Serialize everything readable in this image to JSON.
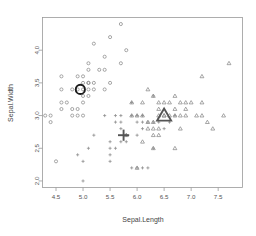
{
  "chart_data": {
    "type": "scatter",
    "title": "",
    "xlabel": "Sepal.Length",
    "ylabel": "Sepal.Width",
    "xlim": [
      4.25,
      7.95
    ],
    "ylim": [
      1.9,
      4.5
    ],
    "xticks": [
      4.5,
      5.0,
      5.5,
      6.0,
      6.5,
      7.0,
      7.5
    ],
    "xtick_labels": [
      "4.5",
      "5.0",
      "5.5",
      "6.0",
      "6.5",
      "7.0",
      "7.5"
    ],
    "yticks": [
      2.0,
      2.5,
      3.0,
      3.5,
      4.0
    ],
    "ytick_labels": [
      "2.0",
      "2.5",
      "3.0",
      "3.5",
      "4.0"
    ],
    "grid": false,
    "legend": "none",
    "series": [
      {
        "name": "cluster-1",
        "marker": "circle",
        "color": "#8a8a8a",
        "points": [
          [
            4.4,
            2.9
          ],
          [
            4.3,
            3.0
          ],
          [
            4.4,
            3.0
          ],
          [
            4.5,
            2.3
          ],
          [
            4.6,
            3.1
          ],
          [
            4.6,
            3.4
          ],
          [
            4.6,
            3.6
          ],
          [
            4.6,
            3.2
          ],
          [
            4.7,
            3.2
          ],
          [
            4.8,
            3.0
          ],
          [
            4.8,
            3.4
          ],
          [
            4.8,
            3.1
          ],
          [
            4.9,
            3.0
          ],
          [
            4.9,
            3.1
          ],
          [
            4.9,
            3.6
          ],
          [
            5.0,
            3.0
          ],
          [
            5.0,
            3.2
          ],
          [
            5.0,
            3.3
          ],
          [
            5.0,
            3.4
          ],
          [
            5.0,
            3.5
          ],
          [
            5.0,
            3.6
          ],
          [
            5.1,
            3.3
          ],
          [
            5.1,
            3.4
          ],
          [
            5.1,
            3.5
          ],
          [
            5.1,
            3.7
          ],
          [
            5.1,
            3.8
          ],
          [
            5.2,
            3.4
          ],
          [
            5.2,
            3.5
          ],
          [
            5.2,
            4.1
          ],
          [
            5.3,
            3.7
          ],
          [
            5.4,
            3.4
          ],
          [
            5.4,
            3.7
          ],
          [
            5.4,
            3.9
          ],
          [
            5.5,
            3.5
          ],
          [
            5.5,
            4.2
          ],
          [
            5.7,
            3.8
          ],
          [
            5.7,
            4.4
          ],
          [
            5.8,
            4.0
          ],
          [
            4.9,
            3.4
          ],
          [
            5.1,
            3.5
          ]
        ]
      },
      {
        "name": "cluster-2",
        "marker": "plus",
        "color": "#8a8a8a",
        "points": [
          [
            4.9,
            2.4
          ],
          [
            5.0,
            2.0
          ],
          [
            5.0,
            2.3
          ],
          [
            5.1,
            2.5
          ],
          [
            5.5,
            2.3
          ],
          [
            5.5,
            2.4
          ],
          [
            5.5,
            2.5
          ],
          [
            5.5,
            2.6
          ],
          [
            5.6,
            2.5
          ],
          [
            5.6,
            2.9
          ],
          [
            5.6,
            3.0
          ],
          [
            5.7,
            2.6
          ],
          [
            5.7,
            2.8
          ],
          [
            5.7,
            2.9
          ],
          [
            5.7,
            3.0
          ],
          [
            5.8,
            2.6
          ],
          [
            5.8,
            2.7
          ],
          [
            5.9,
            3.0
          ],
          [
            5.9,
            3.2
          ],
          [
            5.9,
            2.2
          ],
          [
            6.0,
            2.7
          ],
          [
            6.0,
            2.9
          ],
          [
            6.0,
            3.0
          ],
          [
            6.1,
            2.8
          ],
          [
            6.1,
            2.9
          ],
          [
            6.1,
            3.0
          ],
          [
            6.1,
            2.2
          ],
          [
            6.2,
            2.9
          ],
          [
            6.3,
            2.5
          ],
          [
            6.3,
            2.9
          ],
          [
            6.4,
            2.9
          ],
          [
            6.5,
            2.8
          ],
          [
            6.6,
            2.9
          ],
          [
            6.7,
            3.0
          ],
          [
            5.2,
            2.7
          ],
          [
            5.4,
            3.0
          ],
          [
            5.8,
            2.7
          ],
          [
            6.0,
            2.2
          ],
          [
            6.2,
            2.2
          ],
          [
            6.3,
            3.3
          ]
        ]
      },
      {
        "name": "cluster-3",
        "marker": "triangle",
        "color": "#8a8a8a",
        "points": [
          [
            5.8,
            2.7
          ],
          [
            5.9,
            3.0
          ],
          [
            5.9,
            3.2
          ],
          [
            6.0,
            2.2
          ],
          [
            6.0,
            3.0
          ],
          [
            6.1,
            2.6
          ],
          [
            6.1,
            3.0
          ],
          [
            6.2,
            2.8
          ],
          [
            6.2,
            2.9
          ],
          [
            6.2,
            3.4
          ],
          [
            6.3,
            2.5
          ],
          [
            6.3,
            2.7
          ],
          [
            6.3,
            2.8
          ],
          [
            6.3,
            2.9
          ],
          [
            6.3,
            3.3
          ],
          [
            6.4,
            2.7
          ],
          [
            6.4,
            2.8
          ],
          [
            6.4,
            3.1
          ],
          [
            6.4,
            3.2
          ],
          [
            6.5,
            3.0
          ],
          [
            6.5,
            3.2
          ],
          [
            6.6,
            3.0
          ],
          [
            6.7,
            2.5
          ],
          [
            6.7,
            3.0
          ],
          [
            6.7,
            3.1
          ],
          [
            6.7,
            3.3
          ],
          [
            6.8,
            2.8
          ],
          [
            6.8,
            3.0
          ],
          [
            6.8,
            3.2
          ],
          [
            6.9,
            3.1
          ],
          [
            6.9,
            3.2
          ],
          [
            7.0,
            3.2
          ],
          [
            7.1,
            3.0
          ],
          [
            7.2,
            3.0
          ],
          [
            7.2,
            3.2
          ],
          [
            7.2,
            3.6
          ],
          [
            7.3,
            2.9
          ],
          [
            7.4,
            2.8
          ],
          [
            7.6,
            3.0
          ],
          [
            7.7,
            3.8
          ],
          [
            6.4,
            3.0
          ],
          [
            6.5,
            3.0
          ],
          [
            6.6,
            3.2
          ],
          [
            6.9,
            3.0
          ],
          [
            6.1,
            3.2
          ]
        ]
      }
    ],
    "centroids": [
      {
        "name": "centroid-circle",
        "marker": "circle",
        "x": 4.95,
        "y": 3.4,
        "color": "#1a1a1a"
      },
      {
        "name": "centroid-plus",
        "marker": "plus",
        "x": 5.75,
        "y": 2.7,
        "color": "#555555"
      },
      {
        "name": "centroid-triangle",
        "marker": "triangle",
        "x": 6.5,
        "y": 3.0,
        "color": "#555555"
      }
    ]
  }
}
